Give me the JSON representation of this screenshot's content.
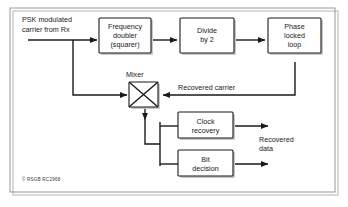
{
  "figure": {
    "kind": "block-diagram",
    "credit": "© RSGB RC2968",
    "frame_color": "#8d8d8d",
    "line_color": "#1a1a1a",
    "shadow_color": "#c9c9c9",
    "background": "#ffffff"
  },
  "blocks": {
    "frequency_doubler": "Frequency\ndoubler\n(squarer)",
    "frequency_doubler_lines": [
      "Frequency",
      "doubler",
      "(squarer)"
    ],
    "divide_by_2": "Divide\nby 2",
    "divide_by_2_lines": [
      "Divide",
      "by 2"
    ],
    "phase_locked_loop": "Phase\nlocked\nloop",
    "phase_locked_loop_lines": [
      "Phase",
      "locked",
      "loop"
    ],
    "clock_recovery": "Clock\nrecovery",
    "clock_recovery_lines": [
      "Clock",
      "recovery"
    ],
    "bit_decision": "Bit\ndecision",
    "bit_decision_lines": [
      "Bit",
      "decision"
    ],
    "mixer_label": "Mixer"
  },
  "signals": {
    "input_lines": [
      "PSK modulated",
      "carrier from Rx"
    ],
    "input": "PSK modulated carrier from Rx",
    "recovered_carrier": "Recovered carrier",
    "recovered_data_lines": [
      "Recovered",
      "data"
    ],
    "recovered_data": "Recovered data"
  }
}
